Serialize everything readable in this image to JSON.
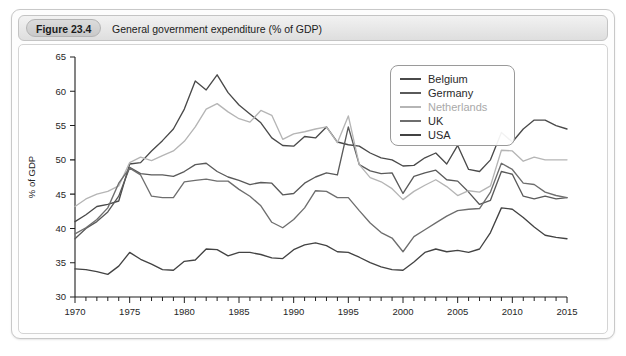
{
  "figure": {
    "number_label": "Figure 23.4",
    "caption": "General government expenditure (% of GDP)"
  },
  "chart_data": {
    "type": "line",
    "title": "General government expenditure (% of GDP)",
    "xlabel": "",
    "ylabel": "% of GDP",
    "xlim": [
      1970,
      2015
    ],
    "ylim": [
      30,
      65
    ],
    "y_ticks": [
      30,
      35,
      40,
      45,
      50,
      55,
      60,
      65
    ],
    "x_ticks": [
      1970,
      1975,
      1980,
      1985,
      1990,
      1995,
      2000,
      2005,
      2010,
      2015
    ],
    "x_minor_tick_interval": 1,
    "grid": false,
    "legend_position": "top-right",
    "x": [
      1970,
      1971,
      1972,
      1973,
      1974,
      1975,
      1976,
      1977,
      1978,
      1979,
      1980,
      1981,
      1982,
      1983,
      1984,
      1985,
      1986,
      1987,
      1988,
      1989,
      1990,
      1991,
      1992,
      1993,
      1994,
      1995,
      1996,
      1997,
      1998,
      1999,
      2000,
      2001,
      2002,
      2003,
      2004,
      2005,
      2006,
      2007,
      2008,
      2009,
      2010,
      2011,
      2012,
      2013,
      2014,
      2015
    ],
    "series": [
      {
        "name": "Belgium",
        "color": "#4a4a4a",
        "values": [
          41.0,
          42.0,
          43.2,
          43.5,
          44.0,
          49.4,
          49.6,
          51.3,
          52.8,
          54.5,
          57.4,
          61.5,
          60.2,
          62.4,
          59.8,
          58.0,
          56.7,
          55.4,
          53.2,
          52.1,
          52.0,
          53.4,
          53.2,
          54.8,
          52.6,
          52.2,
          52.0,
          51.0,
          50.3,
          50.0,
          49.1,
          49.2,
          50.3,
          51.0,
          49.4,
          52.1,
          48.6,
          48.3,
          50.0,
          54.0,
          52.6,
          54.5,
          55.8,
          55.8,
          55.0,
          54.5
        ]
      },
      {
        "name": "Germany",
        "color": "#5a5a5a",
        "values": [
          38.5,
          40.0,
          41.0,
          42.4,
          44.7,
          48.9,
          48.0,
          47.8,
          47.8,
          47.6,
          48.3,
          49.3,
          49.5,
          48.3,
          47.5,
          47.0,
          46.4,
          46.7,
          46.6,
          44.9,
          45.1,
          46.6,
          47.5,
          48.1,
          47.8,
          54.8,
          49.3,
          48.4,
          48.0,
          48.1,
          45.1,
          47.6,
          48.1,
          48.5,
          47.1,
          46.9,
          45.3,
          43.5,
          44.1,
          48.3,
          47.9,
          44.7,
          44.3,
          44.7,
          44.3,
          44.5
        ]
      },
      {
        "name": "Netherlands",
        "color": "#b5b5b5",
        "values": [
          43.2,
          44.3,
          45.0,
          45.4,
          46.2,
          49.6,
          50.4,
          49.9,
          50.6,
          51.3,
          52.7,
          54.8,
          57.4,
          58.2,
          57.0,
          56.0,
          55.5,
          57.2,
          56.5,
          53.0,
          53.8,
          54.1,
          54.5,
          54.8,
          52.5,
          56.4,
          49.3,
          47.4,
          46.8,
          45.8,
          44.2,
          45.4,
          46.3,
          47.1,
          46.1,
          44.8,
          45.5,
          45.3,
          46.2,
          51.4,
          51.3,
          49.8,
          50.4,
          50.0,
          50.0,
          50.0
        ]
      },
      {
        "name": "UK",
        "color": "#6e6e6e",
        "values": [
          39.2,
          40.1,
          41.3,
          43.0,
          46.6,
          48.8,
          47.8,
          44.7,
          44.5,
          44.5,
          46.8,
          47.0,
          47.2,
          46.9,
          46.9,
          45.7,
          44.7,
          43.3,
          40.9,
          40.1,
          41.3,
          43.0,
          45.5,
          45.4,
          44.5,
          44.5,
          42.6,
          40.8,
          39.4,
          38.6,
          36.6,
          38.8,
          39.8,
          40.8,
          41.8,
          42.6,
          42.8,
          42.9,
          45.3,
          49.5,
          48.6,
          46.6,
          46.4,
          45.3,
          44.8,
          44.5
        ]
      },
      {
        "name": "USA",
        "color": "#434343",
        "values": [
          34.1,
          34.0,
          33.7,
          33.3,
          34.5,
          36.5,
          35.5,
          34.8,
          34.0,
          33.9,
          35.2,
          35.4,
          37.0,
          36.9,
          36.0,
          36.5,
          36.5,
          36.2,
          35.7,
          35.6,
          36.9,
          37.6,
          37.9,
          37.5,
          36.6,
          36.5,
          35.8,
          35.0,
          34.4,
          34.0,
          33.9,
          35.1,
          36.5,
          37.0,
          36.6,
          36.8,
          36.5,
          37.0,
          39.4,
          43.0,
          42.8,
          41.6,
          40.2,
          39.0,
          38.7,
          38.5
        ]
      }
    ]
  },
  "legend": {
    "items": [
      {
        "label": "Belgium",
        "color": "#4a4a4a"
      },
      {
        "label": "Germany",
        "color": "#5a5a5a"
      },
      {
        "label": "Netherlands",
        "color": "#b5b5b5"
      },
      {
        "label": "UK",
        "color": "#6e6e6e"
      },
      {
        "label": "USA",
        "color": "#434343"
      }
    ]
  }
}
